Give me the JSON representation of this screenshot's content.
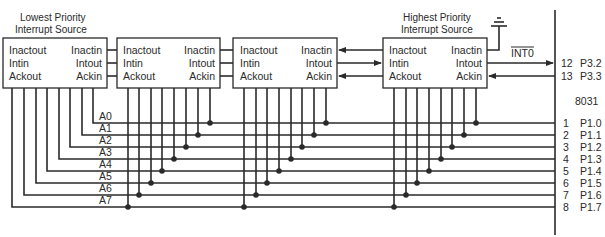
{
  "diagram": {
    "title_lowest": [
      "Lowest Priority",
      "Interrupt Source"
    ],
    "title_highest": [
      "Highest Priority",
      "Interrupt Source"
    ],
    "device_labels": {
      "left": [
        "Inactout",
        "Intin",
        "Ackout"
      ],
      "right": [
        "Inactin",
        "Intout",
        "Ackin"
      ]
    },
    "devices": [
      {
        "id": "device-1",
        "role": "lowest-priority"
      },
      {
        "id": "device-2",
        "role": "middle"
      },
      {
        "id": "device-3",
        "role": "middle"
      },
      {
        "id": "device-4",
        "role": "highest-priority"
      }
    ],
    "signal_int0": "INT0",
    "chip_name": "8031",
    "chip_pins_top": [
      {
        "num": "12",
        "name": "P3.2"
      },
      {
        "num": "13",
        "name": "P3.3"
      }
    ],
    "address_lines": [
      "A0",
      "A1",
      "A2",
      "A3",
      "A4",
      "A5",
      "A6",
      "A7"
    ],
    "chip_pins_port1": [
      {
        "num": "1",
        "name": "P1.0"
      },
      {
        "num": "2",
        "name": "P1.1"
      },
      {
        "num": "3",
        "name": "P1.2"
      },
      {
        "num": "4",
        "name": "P1.3"
      },
      {
        "num": "5",
        "name": "P1.4"
      },
      {
        "num": "6",
        "name": "P1.5"
      },
      {
        "num": "7",
        "name": "P1.6"
      },
      {
        "num": "8",
        "name": "P1.7"
      }
    ],
    "ground_symbol": "ground-icon"
  }
}
